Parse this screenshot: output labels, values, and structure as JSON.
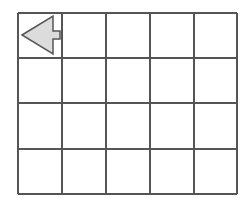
{
  "grid": {
    "columns": 5,
    "rows": 4,
    "x_lines": [
      18,
      62,
      106,
      150,
      194,
      237
    ],
    "y_lines": [
      13,
      58,
      103,
      149,
      194
    ],
    "line_color": "#555555"
  },
  "arrow": {
    "direction": "left",
    "cell": {
      "row": 0,
      "col": 0
    },
    "fill": "#dcdcdc",
    "stroke": "#555555"
  }
}
